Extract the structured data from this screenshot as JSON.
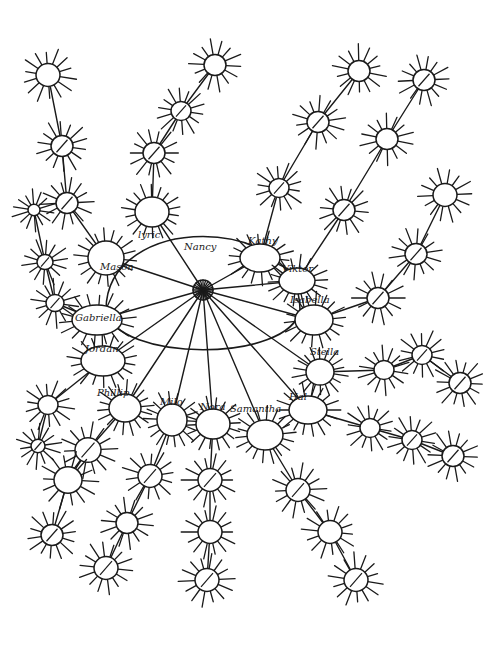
{
  "diagram": {
    "type": "hand-drawn sociogram / network",
    "stroke_color": "#1a1a1a",
    "background": "#ffffff",
    "hub": {
      "cx": 203,
      "cy": 290,
      "rx": 97,
      "ry": 68,
      "center_node": {
        "cx": 203,
        "cy": 290,
        "r": 10
      }
    },
    "labeled_nodes": [
      {
        "id": "lyric",
        "label": "lyric",
        "cx": 152,
        "cy": 212,
        "rx": 17,
        "ry": 15,
        "label_x": 138,
        "label_y": 238
      },
      {
        "id": "nancy",
        "label": "Nancy",
        "cx": 203,
        "cy": 290,
        "rx": 0,
        "ry": 0,
        "label_x": 184,
        "label_y": 250
      },
      {
        "id": "kathy",
        "label": "Kathy",
        "cx": 260,
        "cy": 258,
        "rx": 20,
        "ry": 14,
        "label_x": 248,
        "label_y": 244
      },
      {
        "id": "viktor",
        "label": "Viktor",
        "cx": 297,
        "cy": 281,
        "rx": 18,
        "ry": 13,
        "label_x": 282,
        "label_y": 272
      },
      {
        "id": "isabella",
        "label": "Isabella",
        "cx": 314,
        "cy": 320,
        "rx": 19,
        "ry": 15,
        "label_x": 290,
        "label_y": 303
      },
      {
        "id": "stella",
        "label": "Stella",
        "cx": 320,
        "cy": 372,
        "rx": 14,
        "ry": 13,
        "label_x": 310,
        "label_y": 355
      },
      {
        "id": "hal",
        "label": "Hal",
        "cx": 308,
        "cy": 410,
        "rx": 19,
        "ry": 14,
        "label_x": 289,
        "label_y": 400
      },
      {
        "id": "samantha",
        "label": "Samantha",
        "cx": 265,
        "cy": 435,
        "rx": 18,
        "ry": 15,
        "label_x": 230,
        "label_y": 412
      },
      {
        "id": "nora",
        "label": "Nora",
        "cx": 213,
        "cy": 424,
        "rx": 17,
        "ry": 15,
        "label_x": 200,
        "label_y": 410
      },
      {
        "id": "milo",
        "label": "Milo",
        "cx": 172,
        "cy": 420,
        "rx": 15,
        "ry": 16,
        "label_x": 160,
        "label_y": 405
      },
      {
        "id": "phillip",
        "label": "Phillip",
        "cx": 125,
        "cy": 408,
        "rx": 16,
        "ry": 14,
        "label_x": 97,
        "label_y": 396
      },
      {
        "id": "jordan",
        "label": "Jordan",
        "cx": 103,
        "cy": 361,
        "rx": 22,
        "ry": 15,
        "label_x": 85,
        "label_y": 352
      },
      {
        "id": "gabriella",
        "label": "Gabriella",
        "cx": 97,
        "cy": 320,
        "rx": 25,
        "ry": 15,
        "label_x": 75,
        "label_y": 321
      },
      {
        "id": "mason",
        "label": "Mason",
        "cx": 106,
        "cy": 258,
        "rx": 18,
        "ry": 17,
        "label_x": 100,
        "label_y": 270
      }
    ],
    "unlabeled_nodes": [
      {
        "cx": 48,
        "cy": 75,
        "r": 12
      },
      {
        "cx": 62,
        "cy": 146,
        "r": 11
      },
      {
        "cx": 67,
        "cy": 203,
        "r": 11
      },
      {
        "cx": 34,
        "cy": 210,
        "r": 6
      },
      {
        "cx": 45,
        "cy": 262,
        "r": 8
      },
      {
        "cx": 55,
        "cy": 303,
        "r": 9
      },
      {
        "cx": 215,
        "cy": 65,
        "r": 11
      },
      {
        "cx": 181,
        "cy": 111,
        "r": 10
      },
      {
        "cx": 154,
        "cy": 153,
        "r": 11
      },
      {
        "cx": 359,
        "cy": 71,
        "r": 11
      },
      {
        "cx": 424,
        "cy": 80,
        "r": 11
      },
      {
        "cx": 318,
        "cy": 122,
        "r": 11
      },
      {
        "cx": 387,
        "cy": 139,
        "r": 11
      },
      {
        "cx": 279,
        "cy": 188,
        "r": 10
      },
      {
        "cx": 344,
        "cy": 210,
        "r": 11
      },
      {
        "cx": 445,
        "cy": 195,
        "r": 12
      },
      {
        "cx": 416,
        "cy": 254,
        "r": 11
      },
      {
        "cx": 378,
        "cy": 298,
        "r": 11
      },
      {
        "cx": 384,
        "cy": 370,
        "r": 10
      },
      {
        "cx": 422,
        "cy": 355,
        "r": 10
      },
      {
        "cx": 460,
        "cy": 383,
        "r": 11
      },
      {
        "cx": 370,
        "cy": 428,
        "r": 10
      },
      {
        "cx": 412,
        "cy": 440,
        "r": 10
      },
      {
        "cx": 453,
        "cy": 456,
        "r": 11
      },
      {
        "cx": 48,
        "cy": 405,
        "r": 10
      },
      {
        "cx": 38,
        "cy": 446,
        "r": 7
      },
      {
        "cx": 88,
        "cy": 450,
        "r": 13
      },
      {
        "cx": 68,
        "cy": 480,
        "r": 14
      },
      {
        "cx": 52,
        "cy": 535,
        "r": 11
      },
      {
        "cx": 150,
        "cy": 476,
        "r": 12
      },
      {
        "cx": 127,
        "cy": 523,
        "r": 11
      },
      {
        "cx": 106,
        "cy": 568,
        "r": 12
      },
      {
        "cx": 210,
        "cy": 480,
        "r": 12
      },
      {
        "cx": 210,
        "cy": 532,
        "r": 12
      },
      {
        "cx": 207,
        "cy": 580,
        "r": 12
      },
      {
        "cx": 298,
        "cy": 490,
        "r": 12
      },
      {
        "cx": 330,
        "cy": 532,
        "r": 12
      },
      {
        "cx": 356,
        "cy": 580,
        "r": 12
      }
    ],
    "edges": [
      [
        203,
        290,
        152,
        212
      ],
      [
        152,
        212,
        154,
        153
      ],
      [
        154,
        153,
        181,
        111
      ],
      [
        181,
        111,
        215,
        65
      ],
      [
        203,
        290,
        260,
        258
      ],
      [
        260,
        258,
        279,
        188
      ],
      [
        279,
        188,
        318,
        122
      ],
      [
        318,
        122,
        359,
        71
      ],
      [
        203,
        290,
        297,
        281
      ],
      [
        297,
        281,
        344,
        210
      ],
      [
        344,
        210,
        387,
        139
      ],
      [
        387,
        139,
        424,
        80
      ],
      [
        203,
        290,
        314,
        320
      ],
      [
        314,
        320,
        378,
        298
      ],
      [
        378,
        298,
        416,
        254
      ],
      [
        416,
        254,
        445,
        195
      ],
      [
        320,
        372,
        384,
        370
      ],
      [
        384,
        370,
        422,
        355
      ],
      [
        422,
        355,
        460,
        383
      ],
      [
        308,
        410,
        370,
        428
      ],
      [
        370,
        428,
        412,
        440
      ],
      [
        412,
        440,
        453,
        456
      ],
      [
        265,
        435,
        298,
        490
      ],
      [
        298,
        490,
        330,
        532
      ],
      [
        330,
        532,
        356,
        580
      ],
      [
        213,
        424,
        210,
        480
      ],
      [
        210,
        480,
        210,
        532
      ],
      [
        210,
        532,
        207,
        580
      ],
      [
        172,
        420,
        150,
        476
      ],
      [
        150,
        476,
        127,
        523
      ],
      [
        127,
        523,
        106,
        568
      ],
      [
        125,
        408,
        88,
        450
      ],
      [
        88,
        450,
        68,
        480
      ],
      [
        68,
        480,
        52,
        535
      ],
      [
        103,
        361,
        48,
        405
      ],
      [
        48,
        405,
        38,
        446
      ],
      [
        97,
        320,
        55,
        303
      ],
      [
        55,
        303,
        45,
        262
      ],
      [
        45,
        262,
        34,
        210
      ],
      [
        106,
        258,
        67,
        203
      ],
      [
        67,
        203,
        62,
        146
      ],
      [
        62,
        146,
        48,
        75
      ],
      [
        203,
        290,
        97,
        320
      ],
      [
        203,
        290,
        106,
        258
      ],
      [
        203,
        290,
        103,
        361
      ],
      [
        203,
        290,
        125,
        408
      ],
      [
        203,
        290,
        172,
        420
      ],
      [
        203,
        290,
        213,
        424
      ],
      [
        203,
        290,
        265,
        435
      ],
      [
        203,
        290,
        308,
        410
      ],
      [
        203,
        290,
        320,
        372
      ]
    ]
  }
}
